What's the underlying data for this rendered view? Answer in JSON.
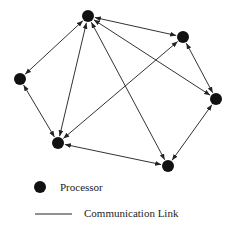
{
  "diagram": {
    "type": "network-graph",
    "colors": {
      "node": "#111111",
      "edge": "#333333",
      "background": "#ffffff"
    },
    "nodes": [
      {
        "id": "A",
        "x": 88,
        "y": 16
      },
      {
        "id": "B",
        "x": 183,
        "y": 37
      },
      {
        "id": "C",
        "x": 20,
        "y": 79
      },
      {
        "id": "D",
        "x": 216,
        "y": 99
      },
      {
        "id": "E",
        "x": 58,
        "y": 143
      },
      {
        "id": "F",
        "x": 168,
        "y": 166
      }
    ],
    "edges": [
      {
        "from": "A",
        "to": "B",
        "bidirectional": true
      },
      {
        "from": "A",
        "to": "C",
        "bidirectional": true
      },
      {
        "from": "A",
        "to": "E",
        "bidirectional": true
      },
      {
        "from": "A",
        "to": "F",
        "bidirectional": true
      },
      {
        "from": "A",
        "to": "D",
        "bidirectional": true
      },
      {
        "from": "B",
        "to": "D",
        "bidirectional": true
      },
      {
        "from": "B",
        "to": "E",
        "bidirectional": true
      },
      {
        "from": "C",
        "to": "E",
        "bidirectional": true
      },
      {
        "from": "E",
        "to": "F",
        "bidirectional": true
      },
      {
        "from": "F",
        "to": "D",
        "bidirectional": true
      }
    ]
  },
  "legend": {
    "processor_label": "Processor",
    "link_label": "Communication Link"
  }
}
